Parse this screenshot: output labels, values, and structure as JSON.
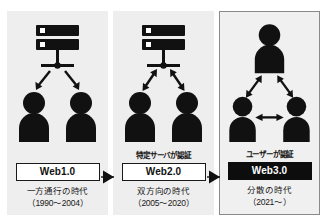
{
  "figure": {
    "title_fragment": "",
    "panels": [
      {
        "id": "web1",
        "auth_label": "",
        "web_label": "Web1.0",
        "era": "一方通行の時代",
        "years": "（1990〜2004）",
        "topology": "server-to-clients-oneway",
        "actor_count": 3,
        "arrow_style": "one-way",
        "highlighted": false,
        "box_style": "outline"
      },
      {
        "id": "web2",
        "auth_label": "特定サーバが認証",
        "web_label": "Web2.0",
        "era": "双方向の時代",
        "years": "（2005〜2020）",
        "topology": "server-to-clients-twoway",
        "actor_count": 3,
        "arrow_style": "two-way",
        "highlighted": false,
        "box_style": "outline"
      },
      {
        "id": "web3",
        "auth_label": "ユーザーが認証",
        "web_label": "Web3.0",
        "era": "分散の時代",
        "years": "（2021〜）",
        "topology": "peer-to-peer-triangle",
        "actor_count": 3,
        "arrow_style": "two-way",
        "highlighted": true,
        "box_style": "inverted"
      }
    ],
    "connectors": [
      {
        "id": "arrow-web1-web2",
        "icon": "solid-right-triangle-arrow"
      },
      {
        "id": "arrow-web2-web3",
        "icon": "solid-right-triangle-arrow"
      }
    ],
    "colors": {
      "ink": "#111111",
      "panel_background": "#eeeeee",
      "highlight_border": "#8a8a8a",
      "inverted_box_background": "#0d0d0d",
      "inverted_box_text": "#ffffff",
      "page_background": "#ffffff"
    },
    "icons": {
      "server": "server-stack-icon",
      "person": "person-icon",
      "arrow_one_way": "arrow-down-icon",
      "arrow_two_way": "arrow-double-headed-icon"
    }
  }
}
